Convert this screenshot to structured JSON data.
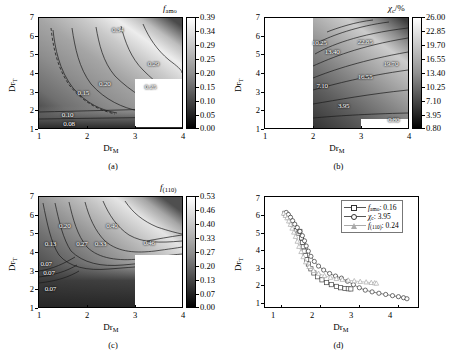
{
  "figure": {
    "panels": [
      {
        "caption": "(a)"
      },
      {
        "caption": "(b)"
      },
      {
        "caption": "(c)"
      },
      {
        "caption": "(d)"
      }
    ]
  },
  "axes": {
    "xlabel": "Dr",
    "xlabel_sub": "M",
    "ylabel": "Dr",
    "ylabel_sub": "T",
    "xticks": [
      "1",
      "2",
      "3",
      "4"
    ],
    "yticks": [
      "1",
      "2",
      "3",
      "4",
      "5",
      "6",
      "7"
    ],
    "xlim": [
      1,
      4
    ],
    "ylim": [
      1,
      7
    ]
  },
  "panel_a": {
    "caption": "(a)",
    "cbar_title": "f",
    "cbar_title_sub": "amo",
    "cbar_ticks": [
      "0.00",
      "0.05",
      "0.10",
      "0.15",
      "0.20",
      "0.25",
      "0.29",
      "0.34",
      "0.39"
    ],
    "contour_labels": [
      "0.08",
      "0.10",
      "0.15",
      "0.20",
      "0.25",
      "0.29",
      "0.34"
    ]
  },
  "panel_b": {
    "caption": "(b)",
    "cbar_title": "χ",
    "cbar_title_sub": "c",
    "cbar_title_unit": "/%",
    "cbar_ticks": [
      "0.80",
      "3.95",
      "7.10",
      "10.25",
      "13.40",
      "16.55",
      "19.70",
      "22.85",
      "26.00"
    ],
    "contour_labels": [
      "0.80",
      "3.95",
      "7.10",
      "10.25",
      "13.40",
      "16.55",
      "19.70",
      "22.85"
    ]
  },
  "panel_c": {
    "caption": "(c)",
    "cbar_title": "f",
    "cbar_title_sub": "(110)",
    "cbar_ticks": [
      "0.00",
      "0.07",
      "0.13",
      "0.20",
      "0.27",
      "0.33",
      "0.40",
      "0.46",
      "0.53"
    ],
    "contour_labels": [
      "0.07",
      "0.07",
      "0.07",
      "0.13",
      "0.20",
      "0.27",
      "0.33",
      "0.40",
      "0.46"
    ]
  },
  "panel_d": {
    "caption": "(d)",
    "legend": [
      {
        "marker": "square",
        "label": "f",
        "label_sub": "amo",
        "value": ": 0.16"
      },
      {
        "marker": "circle",
        "label": "χ",
        "label_sub": "c",
        "value": ": 3.95"
      },
      {
        "marker": "triangle",
        "label": "f",
        "label_sub": "(110)",
        "value": ": 0.24"
      }
    ]
  },
  "chart_data": [
    {
      "type": "heatmap",
      "panel": "(a)",
      "title": "f_amo",
      "xlabel": "Dr_M",
      "ylabel": "Dr_T",
      "xlim": [
        1,
        4
      ],
      "ylim": [
        1,
        7
      ],
      "zlim": [
        0.0,
        0.39
      ],
      "colorbar_ticks": [
        0.0,
        0.05,
        0.1,
        0.15,
        0.2,
        0.25,
        0.29,
        0.34,
        0.39
      ],
      "contour_levels": [
        0.08,
        0.1,
        0.15,
        0.2,
        0.25,
        0.29,
        0.34
      ],
      "grid": false,
      "missing_data_region": {
        "x": [
          3,
          4
        ],
        "y": [
          1,
          2.5
        ]
      },
      "description": "f_amo increases from lower-left/bottom toward upper-right; band of high values near top-right corner."
    },
    {
      "type": "heatmap",
      "panel": "(b)",
      "title": "chi_c/%",
      "xlabel": "Dr_M",
      "ylabel": "Dr_T",
      "xlim": [
        1,
        4
      ],
      "ylim": [
        1,
        7
      ],
      "zlim": [
        0.8,
        26.0
      ],
      "colorbar_ticks": [
        0.8,
        3.95,
        7.1,
        10.25,
        13.4,
        16.55,
        19.7,
        22.85,
        26.0
      ],
      "contour_levels": [
        0.8,
        3.95,
        7.1,
        10.25,
        13.4,
        16.55,
        19.7,
        22.85
      ],
      "grid": false,
      "missing_data_region": {
        "x": [
          1,
          2
        ],
        "y": [
          1,
          7
        ]
      },
      "description": "chi_c rises toward the upper-right; low (dark) values at bottom; no data for Dr_M < 2."
    },
    {
      "type": "heatmap",
      "panel": "(c)",
      "title": "f_(110)",
      "xlabel": "Dr_M",
      "ylabel": "Dr_T",
      "xlim": [
        1,
        4
      ],
      "ylim": [
        1,
        7
      ],
      "zlim": [
        0.0,
        0.53
      ],
      "colorbar_ticks": [
        0.0,
        0.07,
        0.13,
        0.2,
        0.27,
        0.33,
        0.4,
        0.46,
        0.53
      ],
      "contour_levels": [
        0.07,
        0.13,
        0.2,
        0.27,
        0.33,
        0.4,
        0.46
      ],
      "grid": false,
      "missing_data_region": {
        "x": [
          3,
          4
        ],
        "y": [
          1,
          2.6
        ]
      },
      "description": "f_(110) increases with Dr_T and Dr_M; dark low region at the bottom; bright ridge mid/upper-right."
    },
    {
      "type": "scatter",
      "panel": "(d)",
      "xlabel": "Dr_M",
      "ylabel": "Dr_T",
      "xlim": [
        1,
        4.6
      ],
      "ylim": [
        0.6,
        7
      ],
      "grid": false,
      "legend_position": "top-right",
      "series": [
        {
          "name": "f_amo: 0.16",
          "marker": "square",
          "x": [
            1.47,
            1.52,
            1.56,
            1.6,
            1.65,
            1.7,
            1.74,
            1.78,
            1.82,
            1.86,
            1.88,
            1.9,
            1.92,
            1.95,
            1.98,
            2.02,
            2.08,
            2.15,
            2.24,
            2.34,
            2.45,
            2.56,
            2.68,
            2.78,
            2.88,
            2.96,
            3.02
          ],
          "y": [
            6.05,
            5.95,
            5.8,
            5.62,
            5.42,
            5.22,
            5.05,
            4.9,
            5.0,
            4.62,
            4.35,
            4.1,
            3.85,
            3.6,
            3.35,
            3.1,
            2.82,
            2.58,
            2.36,
            2.18,
            2.02,
            1.9,
            1.8,
            1.72,
            1.68,
            1.66,
            1.65
          ]
        },
        {
          "name": "chi_c: 3.95",
          "marker": "circle",
          "x": [
            1.5,
            1.55,
            1.6,
            1.65,
            1.7,
            1.76,
            1.82,
            1.88,
            1.93,
            1.97,
            2.02,
            2.08,
            2.16,
            2.26,
            2.38,
            2.52,
            2.66,
            2.8,
            2.94,
            3.08,
            3.22,
            3.36,
            3.52,
            3.68,
            3.84,
            4.0,
            4.14,
            4.26,
            4.34
          ],
          "y": [
            6.1,
            5.98,
            5.82,
            5.62,
            5.42,
            5.22,
            5.0,
            4.75,
            4.45,
            4.15,
            3.85,
            3.55,
            3.25,
            2.98,
            2.75,
            2.55,
            2.4,
            2.28,
            2.1,
            1.9,
            1.72,
            1.58,
            1.48,
            1.4,
            1.33,
            1.26,
            1.2,
            1.14,
            1.08
          ]
        },
        {
          "name": "f_(110): 0.24",
          "marker": "triangle",
          "x": [
            1.44,
            1.48,
            1.52,
            1.56,
            1.6,
            1.64,
            1.68,
            1.72,
            1.76,
            1.8,
            1.85,
            1.9,
            1.96,
            2.04,
            2.14,
            2.26,
            2.4,
            2.54,
            2.68,
            2.82,
            2.96,
            3.1,
            3.24,
            3.38,
            3.5,
            3.58,
            3.62
          ],
          "y": [
            6.05,
            5.92,
            5.78,
            5.6,
            5.4,
            5.18,
            4.95,
            4.7,
            4.42,
            4.12,
            3.82,
            3.52,
            3.22,
            2.95,
            2.72,
            2.55,
            2.42,
            2.32,
            2.25,
            2.2,
            2.16,
            2.12,
            2.08,
            2.05,
            2.02,
            2.0,
            1.98
          ]
        }
      ]
    }
  ]
}
